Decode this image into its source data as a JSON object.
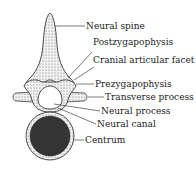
{
  "diagram": {
    "labels": [
      {
        "id": "neural-spine",
        "text": "Neural spine"
      },
      {
        "id": "postzygapophysis",
        "text": "Postzygapophysis"
      },
      {
        "id": "cranial-articular-facet",
        "text": "Cranial articular facet"
      },
      {
        "id": "prezygapophysis",
        "text": "Prezygapophysis"
      },
      {
        "id": "transverse-process",
        "text": "Transverse process"
      },
      {
        "id": "neural-process",
        "text": "Neural process"
      },
      {
        "id": "neural-canal",
        "text": "Neural canal"
      },
      {
        "id": "centrum",
        "text": "Centrum"
      }
    ]
  }
}
